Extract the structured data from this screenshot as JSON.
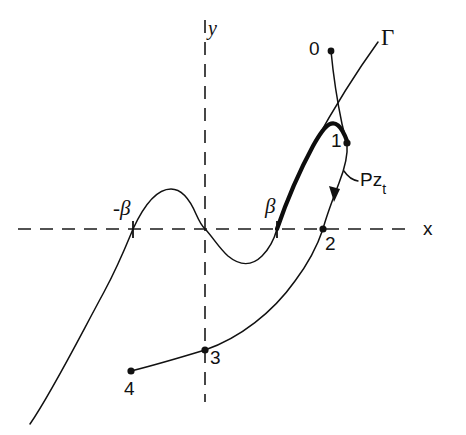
{
  "figure": {
    "kind": "mathematical-contour-diagram",
    "width": 466,
    "height": 435,
    "background_color": "#ffffff",
    "ink_color": "#111111"
  },
  "axes": {
    "x_label": "x",
    "y_label": "y",
    "style": "dashed",
    "origin_px": {
      "x": 205,
      "y": 229
    },
    "x_axis_px": {
      "x1": 18,
      "x2": 414,
      "y": 229
    },
    "y_axis_px": {
      "x": 205,
      "y1": 20,
      "y2": 402
    }
  },
  "curves": {
    "gamma": {
      "label": "Γ",
      "description": "cubic-like curve rising through -beta, local max, inflection at origin, local min, then rising steeply through beta toward upper right",
      "style": "thin",
      "bold_segment": "from beta on the x-axis up through point 1"
    },
    "contour_upper": {
      "description": "thin contour from point 0 descending through point 1 to point 2 on the x-axis, with a downward arrowhead between 1 and 2",
      "style": "thin",
      "arrow_direction": "downward"
    },
    "contour_lower": {
      "description": "thin contour from point 4 rising through point 3 on the y-axis up to point 2",
      "style": "thin"
    }
  },
  "markers": {
    "ticks": [
      {
        "name": "minus-beta-tick",
        "label": "-β",
        "x": 133,
        "y": 229
      },
      {
        "name": "beta-tick",
        "label": "β",
        "x": 277,
        "y": 229
      }
    ],
    "points": [
      {
        "name": "point-0",
        "label": "0",
        "x": 330,
        "y": 49
      },
      {
        "name": "point-1",
        "label": "1",
        "x": 346,
        "y": 143
      },
      {
        "name": "point-2",
        "label": "2",
        "x": 323,
        "y": 229
      },
      {
        "name": "point-3",
        "label": "3",
        "x": 205,
        "y": 350
      },
      {
        "name": "point-4",
        "label": "4",
        "x": 130,
        "y": 371
      }
    ]
  },
  "annotations": {
    "gamma_label": "Γ",
    "operator_label": {
      "base": "Pz",
      "subscript": "t"
    }
  }
}
